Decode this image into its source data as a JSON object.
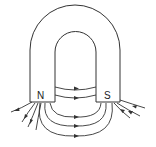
{
  "diagram": {
    "poles": {
      "north": "N",
      "south": "S"
    },
    "colors": {
      "stroke": "#333333",
      "background": "#ffffff"
    },
    "field_lines_between_poles": 5,
    "field_direction": "N to S"
  }
}
